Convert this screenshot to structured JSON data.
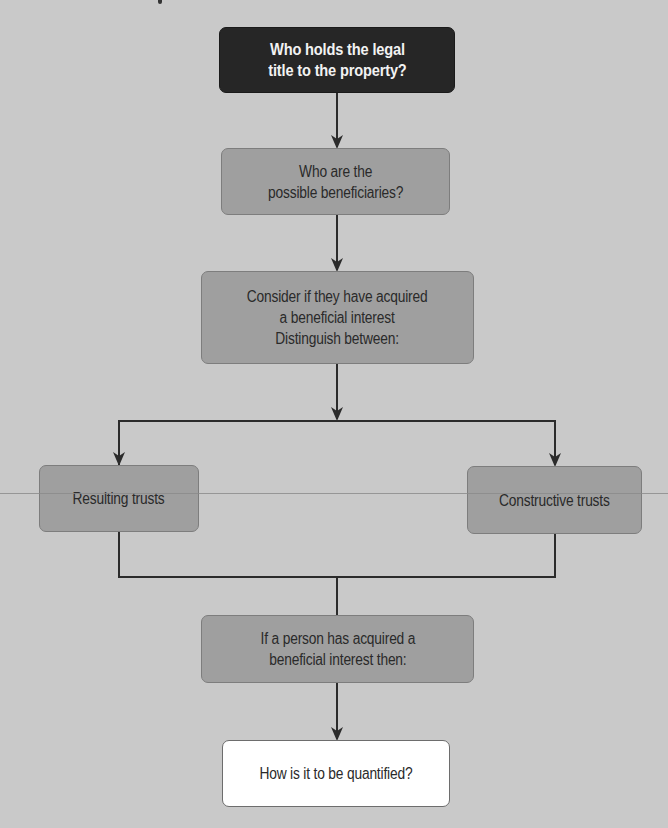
{
  "diagram": {
    "type": "flowchart",
    "colors": {
      "background": "#c9c9c9",
      "dark_node": "#262626",
      "mid_node": "#9f9f9f",
      "light_node": "#ffffff",
      "connector": "#2b2b2b"
    },
    "nodes": [
      {
        "id": "legal-title",
        "label": "Who holds the legal\ntitle to the property?",
        "style": "dark"
      },
      {
        "id": "beneficiaries",
        "label": "Who are the\npossible beneficiaries?",
        "style": "mid"
      },
      {
        "id": "consider",
        "label": "Consider if they have acquired\na beneficial interest\nDistinguish between:",
        "style": "mid"
      },
      {
        "id": "resulting",
        "label": "Resulting trusts",
        "style": "mid"
      },
      {
        "id": "constructive",
        "label": "Constructive trusts",
        "style": "mid"
      },
      {
        "id": "acquired",
        "label": "If a person has acquired a\nbeneficial interest then:",
        "style": "mid"
      },
      {
        "id": "quantified",
        "label": "How is it to be quantified?",
        "style": "light"
      }
    ],
    "edges": [
      {
        "from": "legal-title",
        "to": "beneficiaries",
        "arrow": true
      },
      {
        "from": "beneficiaries",
        "to": "consider",
        "arrow": true
      },
      {
        "from": "consider",
        "to": "resulting",
        "arrow": true
      },
      {
        "from": "consider",
        "to": "constructive",
        "arrow": true
      },
      {
        "from": "resulting",
        "to": "acquired",
        "arrow": false
      },
      {
        "from": "constructive",
        "to": "acquired",
        "arrow": false
      },
      {
        "from": "acquired",
        "to": "quantified",
        "arrow": true
      }
    ]
  }
}
